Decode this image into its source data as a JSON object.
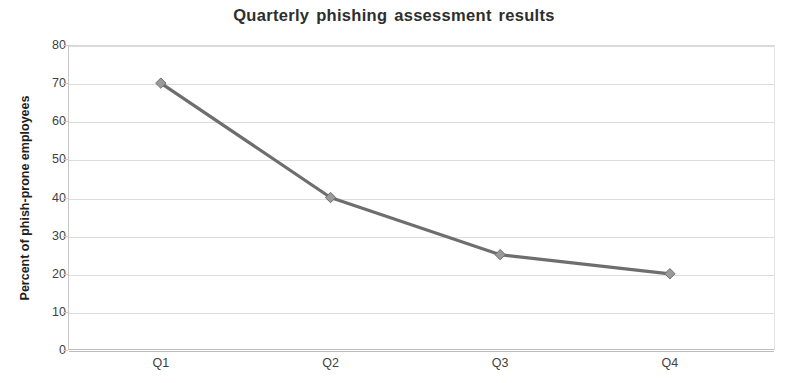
{
  "chart_data": {
    "type": "line",
    "title": "Quarterly phishing assessment results",
    "xlabel": "",
    "ylabel": "Percent of phish-prone employees",
    "categories": [
      "Q1",
      "Q2",
      "Q3",
      "Q4"
    ],
    "values": [
      70,
      40,
      25,
      20
    ],
    "series": [
      {
        "name": "Percent of phish-prone employees",
        "values": [
          70,
          40,
          25,
          20
        ]
      }
    ],
    "ylim": [
      0,
      80
    ],
    "ytick_labels": [
      "80",
      "70",
      "60",
      "50",
      "40",
      "30",
      "20",
      "10",
      "0"
    ],
    "ytick_values": [
      80,
      70,
      60,
      50,
      40,
      30,
      20,
      10,
      0
    ],
    "ystep": 10,
    "grid": "horizontal",
    "legend": "none",
    "marker": "diamond",
    "colors": {
      "line": "#6e6e6e",
      "marker_fill": "#9a9a9a",
      "marker_stroke": "#6e6e6e",
      "gridline": "#dcdcdc",
      "axis": "#bdbdbd",
      "title_text": "#2e2e2e",
      "tick_text": "#3f3f3f",
      "axis_title_text": "#1f1f1f",
      "background": "#ffffff"
    }
  }
}
